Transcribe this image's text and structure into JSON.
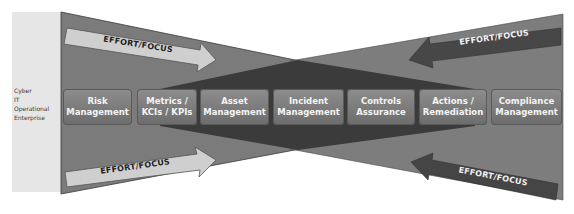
{
  "colors": {
    "outer_triangle": "#7b7b7b",
    "inner_band": "#3b3b3b",
    "label_panel": "#e4e4e4",
    "box_fill_top": "#8d8d8d",
    "box_fill_bottom": "#6c6c6c",
    "arrow_light": "#cfcfcf",
    "arrow_dark": "#444444"
  },
  "side_labels": [
    "Cyber",
    "IT",
    "Operational",
    "Enterprise"
  ],
  "process_boxes": [
    {
      "line1": "Risk",
      "line2": "Management"
    },
    {
      "line1": "Metrics /",
      "line2": "KCIs / KPIs"
    },
    {
      "line1": "Asset",
      "line2": "Management"
    },
    {
      "line1": "Incident",
      "line2": "Management"
    },
    {
      "line1": "Controls",
      "line2": "Assurance"
    },
    {
      "line1": "Actions /",
      "line2": "Remediation"
    },
    {
      "line1": "Compliance",
      "line2": "Management"
    }
  ],
  "arrows": {
    "top_left": "EFFORT/FOCUS",
    "top_right": "EFFORT/FOCUS",
    "bottom_left": "EFFORT/FOCUS",
    "bottom_right": "EFFORT/FOCUS"
  }
}
